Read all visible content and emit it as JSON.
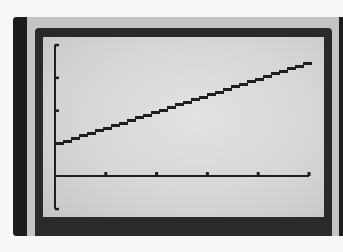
{
  "device": {
    "description": "graphing calculator screen"
  },
  "colors": {
    "bezel_dark": "#1c1c1c",
    "bezel_light": "#c4c4c4",
    "frame": "#2a2a2a",
    "screen": "#d8d8d8",
    "ink": "#1e1e1e"
  },
  "chart_data": {
    "type": "line",
    "title": "",
    "xlabel": "",
    "ylabel": "",
    "xlim": [
      0,
      5
    ],
    "ylim": [
      -1,
      4
    ],
    "grid": false,
    "legend": null,
    "x_ticks": [
      0,
      1,
      2,
      3,
      4,
      5
    ],
    "y_ticks": [
      -1,
      0,
      1,
      2,
      3,
      4
    ],
    "tick_labels_visible": false,
    "series": [
      {
        "name": "y = 0.5x + 1",
        "style": "pixelated stair-step line",
        "x": [
          0,
          1,
          2,
          3,
          4,
          5
        ],
        "y": [
          1,
          1.5,
          2,
          2.5,
          3,
          3.5
        ]
      }
    ]
  }
}
